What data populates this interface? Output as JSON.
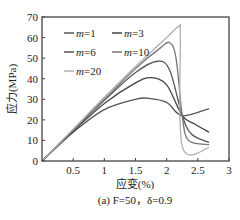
{
  "chart_data": {
    "type": "line",
    "title": "",
    "caption": "(a) F=50，δ=0.9",
    "xlabel": "应变(%)",
    "ylabel": "应力(MPa)",
    "xlim": [
      0,
      3
    ],
    "ylim": [
      0,
      70
    ],
    "xticks": [
      "0.5",
      "1",
      "1.5",
      "2",
      "2.5",
      "3"
    ],
    "yticks": [
      "0",
      "10",
      "20",
      "30",
      "40",
      "50",
      "60",
      "70"
    ],
    "legend": [
      "m=1",
      "m=3",
      "m=6",
      "m=10",
      "m=20"
    ],
    "legend_position": "upper left",
    "grid": false,
    "series": [
      {
        "name": "m=1",
        "color": "#555555",
        "x": [
          0,
          0.5,
          1.0,
          1.5,
          1.7,
          2.0,
          2.25,
          2.68
        ],
        "y": [
          0,
          14,
          25,
          30,
          30.5,
          28.5,
          22,
          25.5
        ]
      },
      {
        "name": "m=3",
        "color": "#444444",
        "x": [
          0,
          0.5,
          1.0,
          1.5,
          1.75,
          2.0,
          2.25,
          2.45,
          2.68
        ],
        "y": [
          0,
          14.5,
          28,
          38,
          40.5,
          37,
          22,
          18,
          14
        ]
      },
      {
        "name": "m=6",
        "color": "#555555",
        "x": [
          0,
          0.5,
          1.0,
          1.5,
          1.85,
          2.05,
          2.25,
          2.4,
          2.68
        ],
        "y": [
          0,
          15,
          29.5,
          43,
          48.5,
          44,
          22,
          13,
          9
        ]
      },
      {
        "name": "m=10",
        "color": "#777777",
        "x": [
          0,
          0.5,
          1.0,
          1.5,
          1.9,
          2.05,
          2.15,
          2.25,
          2.35,
          2.68
        ],
        "y": [
          0,
          15,
          30,
          45,
          55,
          57.5,
          50,
          22,
          10,
          8
        ]
      },
      {
        "name": "m=20",
        "color": "#b0b0b0",
        "x": [
          0,
          0.5,
          1.0,
          1.5,
          2.0,
          2.2,
          2.22,
          2.25,
          2.68
        ],
        "y": [
          0,
          15.5,
          31,
          46,
          60,
          65.5,
          60,
          7,
          6.5
        ]
      }
    ]
  }
}
